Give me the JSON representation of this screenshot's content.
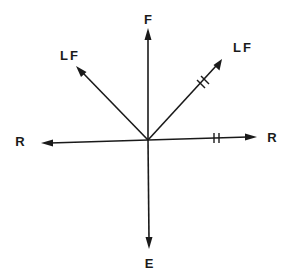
{
  "diagram": {
    "type": "vector-diagram",
    "origin": {
      "x": 148,
      "y": 140
    },
    "colors": {
      "ink": "#1a1a1a",
      "background": "#ffffff"
    },
    "vectors": [
      {
        "id": "F",
        "label": "F",
        "direction": "up",
        "tip": [
          148,
          29
        ],
        "label_pos": [
          148,
          24
        ],
        "equal_marks": 0
      },
      {
        "id": "E",
        "label": "E",
        "direction": "down",
        "tip": [
          149,
          248
        ],
        "label_pos": [
          149,
          267
        ],
        "equal_marks": 0
      },
      {
        "id": "R-left",
        "label": "R",
        "direction": "left",
        "tip": [
          42,
          143
        ],
        "label_pos": [
          20,
          146
        ],
        "equal_marks": 0
      },
      {
        "id": "R-right",
        "label": "R",
        "direction": "right",
        "tip": [
          256,
          137
        ],
        "label_pos": [
          272,
          142
        ],
        "equal_marks": 2
      },
      {
        "id": "LF-left",
        "label": "LF",
        "direction": "up-left",
        "tip": [
          77,
          67
        ],
        "label_pos": [
          69,
          60
        ],
        "equal_marks": 0
      },
      {
        "id": "LF-right",
        "label": "LF",
        "direction": "up-right",
        "tip": [
          222,
          60
        ],
        "label_pos": [
          242,
          52
        ],
        "equal_marks": 2
      }
    ]
  }
}
